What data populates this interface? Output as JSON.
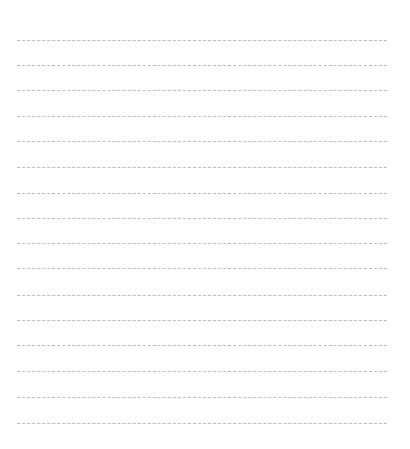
{
  "page": {
    "type": "blank ruled sheet",
    "background_color": "#ffffff",
    "rule_color": "#bdbdbd",
    "rule_style": "dashed",
    "rule_count": 16,
    "rules": [
      {
        "y": 40
      },
      {
        "y": 65
      },
      {
        "y": 90
      },
      {
        "y": 116
      },
      {
        "y": 141
      },
      {
        "y": 167
      },
      {
        "y": 193
      },
      {
        "y": 218
      },
      {
        "y": 243
      },
      {
        "y": 268
      },
      {
        "y": 295
      },
      {
        "y": 320
      },
      {
        "y": 345
      },
      {
        "y": 371
      },
      {
        "y": 397
      },
      {
        "y": 423
      }
    ]
  }
}
